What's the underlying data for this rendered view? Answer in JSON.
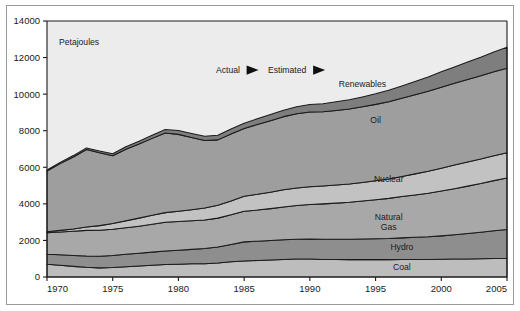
{
  "figure": {
    "unit_label": "Petajoules",
    "annotations": [
      {
        "name": "actual",
        "label": "Actual",
        "marker": "right-triangle-icon"
      },
      {
        "name": "estimated",
        "label": "Estimated",
        "marker": "right-triangle-icon"
      }
    ]
  },
  "chart_data": {
    "type": "area",
    "stacked": true,
    "title": "",
    "subtitle": "",
    "xlabel": "",
    "ylabel": "Petajoules",
    "xlim": [
      1970,
      2005
    ],
    "ylim": [
      0,
      14000
    ],
    "ytick_labels": [
      "0",
      "2000",
      "4000",
      "6000",
      "8000",
      "10000",
      "12000",
      "14000"
    ],
    "yticks": [
      0,
      2000,
      4000,
      6000,
      8000,
      10000,
      12000,
      14000
    ],
    "xtick_labels": [
      "1970",
      "1975",
      "1980",
      "1985",
      "1990",
      "1995",
      "2000",
      "2005"
    ],
    "xticks": [
      1970,
      1975,
      1980,
      1985,
      1990,
      1995,
      2000,
      2005
    ],
    "grid": false,
    "legend_position": "inline-band-labels",
    "x": [
      1970,
      1971,
      1972,
      1973,
      1974,
      1975,
      1976,
      1977,
      1978,
      1979,
      1980,
      1981,
      1982,
      1983,
      1984,
      1985,
      1986,
      1987,
      1988,
      1989,
      1990,
      1991,
      1992,
      1993,
      1994,
      1995,
      1996,
      1997,
      1998,
      1999,
      2000,
      2001,
      2002,
      2003,
      2004,
      2005
    ],
    "series": [
      {
        "name": "Coal",
        "color": "#bdbdbd",
        "label_x": 1997,
        "label_y": 380,
        "values": [
          700,
          640,
          580,
          530,
          500,
          520,
          560,
          600,
          640,
          680,
          700,
          720,
          730,
          760,
          830,
          880,
          900,
          930,
          960,
          980,
          980,
          960,
          960,
          950,
          950,
          950,
          950,
          960,
          960,
          960,
          970,
          980,
          990,
          1000,
          1010,
          1020
        ]
      },
      {
        "name": "Hydro",
        "color": "#8e8e8e",
        "label_x": 1997,
        "label_y": 1450,
        "values": [
          540,
          580,
          600,
          620,
          640,
          660,
          680,
          700,
          720,
          740,
          760,
          790,
          830,
          880,
          950,
          1040,
          1060,
          1070,
          1080,
          1090,
          1100,
          1110,
          1110,
          1120,
          1130,
          1140,
          1150,
          1180,
          1210,
          1240,
          1280,
          1330,
          1390,
          1450,
          1520,
          1580
        ]
      },
      {
        "name": "Natural Gas",
        "color": "#a8a8a8",
        "label_x": 1996,
        "label_y": 3100,
        "values": [
          1180,
          1240,
          1320,
          1400,
          1420,
          1430,
          1450,
          1480,
          1520,
          1570,
          1580,
          1570,
          1560,
          1580,
          1620,
          1680,
          1700,
          1740,
          1790,
          1840,
          1890,
          1930,
          1970,
          2020,
          2080,
          2140,
          2200,
          2260,
          2320,
          2380,
          2450,
          2520,
          2590,
          2660,
          2740,
          2810
        ]
      },
      {
        "name": "Nuclear",
        "color": "#c2c2c2",
        "label_x": 1996,
        "label_y": 5200,
        "values": [
          60,
          90,
          130,
          180,
          250,
          320,
          380,
          440,
          500,
          530,
          560,
          600,
          650,
          700,
          760,
          820,
          860,
          900,
          940,
          960,
          970,
          980,
          990,
          1000,
          1010,
          1030,
          1060,
          1100,
          1150,
          1200,
          1250,
          1290,
          1320,
          1340,
          1360,
          1380
        ]
      },
      {
        "name": "Oil",
        "color": "#9e9e9e",
        "label_x": 1995,
        "label_y": 8400,
        "values": [
          3310,
          3650,
          3930,
          4240,
          3980,
          3700,
          3920,
          4050,
          4200,
          4360,
          4200,
          3950,
          3700,
          3580,
          3660,
          3700,
          3820,
          3910,
          4000,
          4060,
          4080,
          4060,
          4080,
          4100,
          4140,
          4180,
          4230,
          4280,
          4330,
          4380,
          4430,
          4470,
          4510,
          4550,
          4590,
          4620
        ]
      },
      {
        "name": "Renewables",
        "color": "#7e7e7e",
        "label_x": 1994,
        "label_y": 10400,
        "values": [
          60,
          70,
          80,
          90,
          100,
          110,
          130,
          150,
          170,
          190,
          210,
          220,
          230,
          250,
          270,
          290,
          310,
          330,
          350,
          380,
          410,
          440,
          470,
          500,
          540,
          580,
          620,
          670,
          720,
          780,
          840,
          900,
          960,
          1020,
          1080,
          1150
        ]
      }
    ],
    "totals_note": "Stacked totals rise from about 5850 in 1970 to about 11560 in 2005",
    "background": "#ececec"
  }
}
